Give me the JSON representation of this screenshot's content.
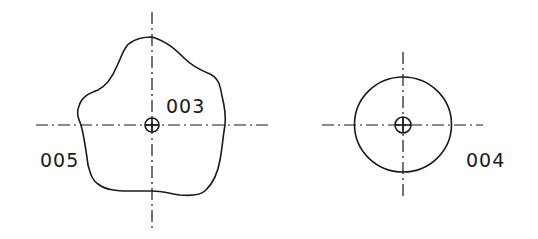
{
  "figure": {
    "views": [
      {
        "id": "left-view",
        "label": "003",
        "secondary_label": "005",
        "shape": "irregular-outline",
        "center": [
          152,
          125
        ]
      },
      {
        "id": "right-view",
        "label": "004",
        "shape": "circle",
        "center": [
          403,
          125
        ]
      }
    ]
  },
  "labels": {
    "ref_003": "003",
    "ref_005": "005",
    "ref_004": "004"
  },
  "colors": {
    "line": "#1a1a1a",
    "background": "#ffffff"
  }
}
